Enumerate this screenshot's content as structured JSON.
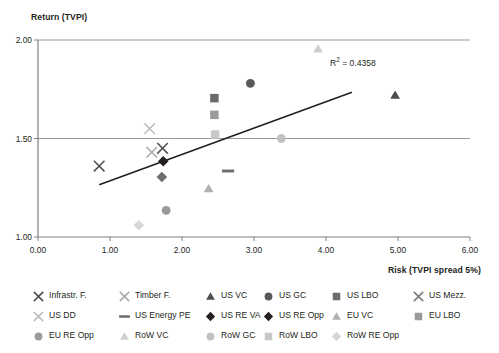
{
  "chart_data": {
    "type": "scatter",
    "title": "",
    "xlabel": "Risk (TVPI spread 5%)",
    "ylabel": "Return (TVPI)",
    "xlim": [
      0.0,
      6.0
    ],
    "ylim": [
      1.0,
      2.0
    ],
    "xticks": [
      "0.00",
      "1.00",
      "2.00",
      "3.00",
      "4.00",
      "5.00",
      "6.00"
    ],
    "yticks": [
      "1.00",
      "1.50",
      "2.00"
    ],
    "grid": "horizontal-gridline-at-1.50-and-2.00",
    "legend_position": "bottom",
    "annotation": "R2 = 0.4358",
    "annotation_value": 0.4358,
    "trendline": {
      "name": "linear-trendline",
      "x_start": 0.85,
      "y_start": 1.265,
      "x_end": 4.36,
      "y_end": 1.735,
      "color": "#231f20"
    },
    "points": [
      {
        "series": "Infrastr. F.",
        "x": 0.85,
        "y": 1.36,
        "marker": "x",
        "color": "#4d4d4d"
      },
      {
        "series": "Timber F.",
        "x": 1.58,
        "y": 1.43,
        "marker": "x",
        "color": "#a8a8a8"
      },
      {
        "series": "US DD",
        "x": 1.55,
        "y": 1.55,
        "marker": "x",
        "color": "#bdbdbd"
      },
      {
        "series": "US Mezz.",
        "x": 1.73,
        "y": 1.45,
        "marker": "x",
        "color": "#4d4d4d"
      },
      {
        "series": "US RE VA",
        "x": 1.74,
        "y": 1.385,
        "marker": "diamond",
        "color": "#231f20"
      },
      {
        "series": "US RE Opp",
        "x": 1.72,
        "y": 1.305,
        "marker": "diamond",
        "color": "#6e6e6e"
      },
      {
        "series": "RoW RE Opp",
        "x": 1.4,
        "y": 1.06,
        "marker": "diamond",
        "color": "#d6d6d6"
      },
      {
        "series": "EU RE Opp",
        "x": 1.78,
        "y": 1.135,
        "marker": "circle",
        "color": "#9a9a9a"
      },
      {
        "series": "US LBO",
        "x": 2.45,
        "y": 1.705,
        "marker": "square",
        "color": "#6b6b6b"
      },
      {
        "series": "EU LBO",
        "x": 2.45,
        "y": 1.62,
        "marker": "square",
        "color": "#9a9a9a"
      },
      {
        "series": "RoW LBO",
        "x": 2.46,
        "y": 1.52,
        "marker": "square",
        "color": "#c8c8c8"
      },
      {
        "series": "US Energy PE",
        "x": 2.64,
        "y": 1.335,
        "marker": "dash",
        "color": "#6e6e6e"
      },
      {
        "series": "EU VC",
        "x": 2.37,
        "y": 1.245,
        "marker": "triangle",
        "color": "#b0b0b0"
      },
      {
        "series": "US GC",
        "x": 2.95,
        "y": 1.78,
        "marker": "circle",
        "color": "#595959"
      },
      {
        "series": "RoW GC",
        "x": 3.38,
        "y": 1.5,
        "marker": "circle",
        "color": "#c2c2c2"
      },
      {
        "series": "RoW VC",
        "x": 3.89,
        "y": 1.955,
        "marker": "triangle",
        "color": "#cfcfcf"
      },
      {
        "series": "US VC",
        "x": 4.96,
        "y": 1.72,
        "marker": "triangle",
        "color": "#4d4d4d"
      }
    ]
  },
  "legend": {
    "items": [
      {
        "label": "Infrastr. F.",
        "marker": "x",
        "color": "#4d4d4d",
        "col": 0,
        "row": 0
      },
      {
        "label": "Timber F.",
        "marker": "x",
        "color": "#a8a8a8",
        "col": 1,
        "row": 0
      },
      {
        "label": "US VC",
        "marker": "triangle",
        "color": "#4d4d4d",
        "col": 2,
        "row": 0
      },
      {
        "label": "US GC",
        "marker": "circle",
        "color": "#595959",
        "col": 3,
        "row": 0
      },
      {
        "label": "US LBO",
        "marker": "square",
        "color": "#6b6b6b",
        "col": 4,
        "row": 0
      },
      {
        "label": "US Mezz.",
        "marker": "x",
        "color": "#7a7a7a",
        "col": 5,
        "row": 0
      },
      {
        "label": "US DD",
        "marker": "x",
        "color": "#bdbdbd",
        "col": 0,
        "row": 1
      },
      {
        "label": "US Energy PE",
        "marker": "dash",
        "color": "#6e6e6e",
        "col": 1,
        "row": 1
      },
      {
        "label": "US RE VA",
        "marker": "diamond",
        "color": "#231f20",
        "col": 2,
        "row": 1
      },
      {
        "label": "US RE Opp",
        "marker": "diamond",
        "color": "#231f20",
        "col": 3,
        "row": 1
      },
      {
        "label": "EU VC",
        "marker": "triangle",
        "color": "#b0b0b0",
        "col": 4,
        "row": 1
      },
      {
        "label": "EU LBO",
        "marker": "square",
        "color": "#9a9a9a",
        "col": 5,
        "row": 1
      },
      {
        "label": "EU RE Opp",
        "marker": "circle",
        "color": "#9a9a9a",
        "col": 0,
        "row": 2
      },
      {
        "label": "RoW VC",
        "marker": "triangle",
        "color": "#cfcfcf",
        "col": 1,
        "row": 2
      },
      {
        "label": "RoW GC",
        "marker": "circle",
        "color": "#c2c2c2",
        "col": 2,
        "row": 2
      },
      {
        "label": "RoW LBO",
        "marker": "square",
        "color": "#c8c8c8",
        "col": 3,
        "row": 2
      },
      {
        "label": "RoW RE Opp",
        "marker": "diamond",
        "color": "#d6d6d6",
        "col": 4,
        "row": 2
      }
    ]
  },
  "colors": {
    "axis": "#808080",
    "gridline": "#9a9a9a",
    "text": "#231f20",
    "trendline": "#231f20"
  }
}
